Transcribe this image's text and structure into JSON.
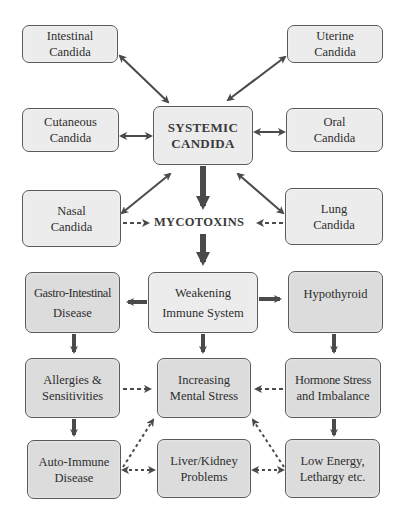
{
  "diagram": {
    "title_partial": "",
    "center_label": "MYCOTOXINS",
    "nodes": {
      "intestinal": {
        "line1": "Intestinal",
        "line2": "Candida"
      },
      "uterine": {
        "line1": "Uterine",
        "line2": "Candida"
      },
      "cutaneous": {
        "line1": "Cutaneous",
        "line2": "Candida"
      },
      "systemic": {
        "line1": "SYSTEMIC",
        "line2": "CANDIDA"
      },
      "oral": {
        "line1": "Oral",
        "line2": "Candida"
      },
      "nasal": {
        "line1": "Nasal",
        "line2": "Candida"
      },
      "lung": {
        "line1": "Lung",
        "line2": "Candida"
      },
      "gastro": {
        "line1": "Gastro-Intestinal",
        "line2": "Disease"
      },
      "weakening": {
        "line1": "Weakening",
        "line2": "Immune System"
      },
      "hypothyroid": {
        "line1": "Hypothyroid",
        "line2": ""
      },
      "allergies": {
        "line1": "Allergies &",
        "line2": "Sensitivities"
      },
      "mental": {
        "line1": "Increasing",
        "line2": "Mental Stress"
      },
      "hormone": {
        "line1": "Hormone Stress",
        "line2": "and Imbalance"
      },
      "autoimmune": {
        "line1": "Auto-Immune",
        "line2": "Disease"
      },
      "liver": {
        "line1": "Liver/Kidney",
        "line2": "Problems"
      },
      "lowenergy": {
        "line1": "Low Energy,",
        "line2": "Lethargy etc."
      }
    },
    "edges": [
      {
        "from": "intestinal",
        "to": "systemic",
        "style": "solid",
        "direction": "both"
      },
      {
        "from": "uterine",
        "to": "systemic",
        "style": "solid",
        "direction": "both"
      },
      {
        "from": "cutaneous",
        "to": "systemic",
        "style": "solid",
        "direction": "both"
      },
      {
        "from": "oral",
        "to": "systemic",
        "style": "solid",
        "direction": "both"
      },
      {
        "from": "nasal",
        "to": "systemic",
        "style": "solid",
        "direction": "both"
      },
      {
        "from": "lung",
        "to": "systemic",
        "style": "solid",
        "direction": "both"
      },
      {
        "from": "systemic",
        "to": "mycotoxins",
        "style": "thick",
        "direction": "forward"
      },
      {
        "from": "nasal",
        "to": "mycotoxins",
        "style": "dashed",
        "direction": "forward"
      },
      {
        "from": "lung",
        "to": "mycotoxins",
        "style": "dashed",
        "direction": "forward"
      },
      {
        "from": "mycotoxins",
        "to": "weakening",
        "style": "thick",
        "direction": "forward"
      },
      {
        "from": "weakening",
        "to": "gastro",
        "style": "thick",
        "direction": "forward"
      },
      {
        "from": "weakening",
        "to": "hypothyroid",
        "style": "thick",
        "direction": "forward"
      },
      {
        "from": "gastro",
        "to": "allergies",
        "style": "thick",
        "direction": "forward"
      },
      {
        "from": "weakening",
        "to": "mental",
        "style": "thick",
        "direction": "forward"
      },
      {
        "from": "hypothyroid",
        "to": "hormone",
        "style": "thick",
        "direction": "forward"
      },
      {
        "from": "allergies",
        "to": "mental",
        "style": "dashed",
        "direction": "forward"
      },
      {
        "from": "hormone",
        "to": "mental",
        "style": "dashed",
        "direction": "forward"
      },
      {
        "from": "allergies",
        "to": "autoimmune",
        "style": "thick",
        "direction": "forward"
      },
      {
        "from": "hormone",
        "to": "lowenergy",
        "style": "thick",
        "direction": "forward"
      },
      {
        "from": "autoimmune",
        "to": "mental",
        "style": "dashed",
        "direction": "forward"
      },
      {
        "from": "lowenergy",
        "to": "mental",
        "style": "dashed",
        "direction": "forward"
      },
      {
        "from": "autoimmune",
        "to": "liver",
        "style": "dashed",
        "direction": "both"
      },
      {
        "from": "lowenergy",
        "to": "liver",
        "style": "dashed",
        "direction": "both"
      }
    ],
    "colors": {
      "box_fill": "#dcdcdc",
      "box_fill_light": "#ececec",
      "border": "#5a5a5a",
      "arrow": "#4a4a4a",
      "text": "#2e2e2e"
    }
  }
}
